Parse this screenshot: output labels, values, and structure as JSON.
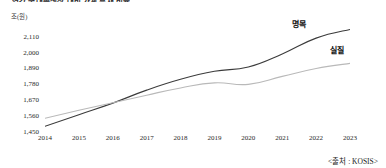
{
  "title": "연간 국내총생산 대비 가계 부채 비율",
  "unit_label": "조(원)",
  "source": "<출처 : KOSIS>",
  "labels": {
    "nominal": "명목",
    "real": "실질"
  },
  "colors": {
    "nominal": "#3b3b3b",
    "real": "#b9b9b9",
    "text": "#1a1a1a"
  },
  "chart_data": {
    "type": "line",
    "title": "연간 국내총생산 대비 가계 부채 비율",
    "xlabel": "",
    "ylabel": "조(원)",
    "categories": [
      "2014",
      "2015",
      "2016",
      "2017",
      "2018",
      "2019",
      "2020",
      "2021",
      "2022",
      "2023"
    ],
    "yticks": [
      "1,450",
      "1,560",
      "1,670",
      "1,780",
      "1,890",
      "2,000",
      "2,110"
    ],
    "ytick_values": [
      1450,
      1560,
      1670,
      1780,
      1890,
      2000,
      2110
    ],
    "ylim": [
      1450,
      2170
    ],
    "grid": false,
    "legend_position": "inline-right",
    "series": [
      {
        "name": "명목",
        "color": "#3b3b3b",
        "values": [
          1490,
          1570,
          1650,
          1740,
          1815,
          1870,
          1900,
          1990,
          2100,
          2160
        ]
      },
      {
        "name": "실질",
        "color": "#b9b9b9",
        "values": [
          1545,
          1600,
          1652,
          1705,
          1755,
          1790,
          1780,
          1835,
          1890,
          1925
        ]
      }
    ]
  }
}
